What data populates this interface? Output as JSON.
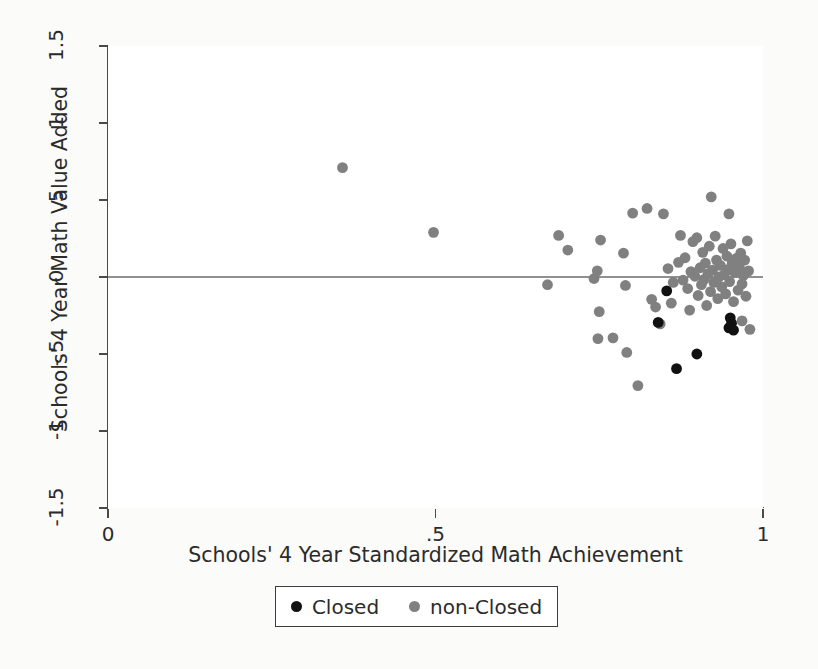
{
  "chart_data": {
    "type": "scatter",
    "title": "",
    "xlabel": "Schools' 4 Year Standardized Math Achievement",
    "ylabel": "Schools' 4 Year Math Value Added",
    "xlim": [
      0,
      1
    ],
    "ylim": [
      -1.5,
      1.5
    ],
    "xticks": [
      "0",
      ".5",
      "1"
    ],
    "xtick_values": [
      0,
      0.5,
      1
    ],
    "yticks": [
      "1.5",
      "1",
      ".5",
      "0",
      "-.5",
      "-1",
      "-1.5"
    ],
    "ytick_values": [
      1.5,
      1,
      0.5,
      0,
      -0.5,
      -1,
      -1.5
    ],
    "grid": false,
    "reference_line": {
      "orientation": "horizontal",
      "y": 0,
      "color": "#6b6b6b"
    },
    "legend_position": "below-axis",
    "series": [
      {
        "name": "Closed",
        "color": "#111111",
        "marker": "circle",
        "points": [
          [
            0.853,
            -0.09
          ],
          [
            0.84,
            -0.295
          ],
          [
            0.868,
            -0.595
          ],
          [
            0.899,
            -0.5
          ],
          [
            0.95,
            -0.265
          ],
          [
            0.952,
            -0.3
          ],
          [
            0.948,
            -0.33
          ],
          [
            0.955,
            -0.345
          ]
        ]
      },
      {
        "name": "non-Closed",
        "color": "#808080",
        "marker": "circle",
        "points": [
          [
            0.358,
            0.71
          ],
          [
            0.497,
            0.29
          ],
          [
            0.671,
            -0.05
          ],
          [
            0.688,
            0.27
          ],
          [
            0.702,
            0.175
          ],
          [
            0.742,
            -0.01
          ],
          [
            0.747,
            0.04
          ],
          [
            0.752,
            0.24
          ],
          [
            0.75,
            -0.225
          ],
          [
            0.748,
            -0.4
          ],
          [
            0.771,
            -0.395
          ],
          [
            0.787,
            0.155
          ],
          [
            0.79,
            -0.055
          ],
          [
            0.792,
            -0.49
          ],
          [
            0.801,
            0.415
          ],
          [
            0.809,
            -0.705
          ],
          [
            0.823,
            0.445
          ],
          [
            0.83,
            -0.145
          ],
          [
            0.836,
            -0.195
          ],
          [
            0.843,
            -0.305
          ],
          [
            0.848,
            0.41
          ],
          [
            0.855,
            0.055
          ],
          [
            0.86,
            -0.17
          ],
          [
            0.863,
            -0.035
          ],
          [
            0.871,
            0.095
          ],
          [
            0.874,
            0.27
          ],
          [
            0.878,
            -0.02
          ],
          [
            0.881,
            0.125
          ],
          [
            0.885,
            -0.075
          ],
          [
            0.888,
            -0.215
          ],
          [
            0.89,
            0.035
          ],
          [
            0.893,
            0.23
          ],
          [
            0.896,
            0.005
          ],
          [
            0.899,
            0.255
          ],
          [
            0.901,
            -0.12
          ],
          [
            0.904,
            0.06
          ],
          [
            0.906,
            -0.05
          ],
          [
            0.908,
            0.16
          ],
          [
            0.91,
            -0.015
          ],
          [
            0.912,
            0.09
          ],
          [
            0.914,
            -0.185
          ],
          [
            0.916,
            0.02
          ],
          [
            0.918,
            0.2
          ],
          [
            0.92,
            -0.095
          ],
          [
            0.921,
            0.52
          ],
          [
            0.923,
            0.045
          ],
          [
            0.925,
            -0.035
          ],
          [
            0.927,
            0.265
          ],
          [
            0.929,
            0.11
          ],
          [
            0.931,
            -0.14
          ],
          [
            0.933,
            0.0
          ],
          [
            0.935,
            0.075
          ],
          [
            0.937,
            -0.065
          ],
          [
            0.939,
            0.185
          ],
          [
            0.941,
            0.015
          ],
          [
            0.943,
            -0.11
          ],
          [
            0.945,
            0.135
          ],
          [
            0.947,
            0.05
          ],
          [
            0.949,
            -0.03
          ],
          [
            0.951,
            0.215
          ],
          [
            0.953,
            0.09
          ],
          [
            0.955,
            -0.16
          ],
          [
            0.957,
            0.03
          ],
          [
            0.959,
            0.12
          ],
          [
            0.948,
            0.41
          ],
          [
            0.962,
            -0.085
          ],
          [
            0.964,
            0.065
          ],
          [
            0.966,
            0.155
          ],
          [
            0.968,
            -0.045
          ],
          [
            0.97,
            0.01
          ],
          [
            0.972,
            0.11
          ],
          [
            0.974,
            -0.125
          ],
          [
            0.976,
            0.235
          ],
          [
            0.978,
            0.04
          ],
          [
            0.98,
            -0.34
          ],
          [
            0.968,
            -0.285
          ]
        ]
      }
    ]
  },
  "axes": {
    "y_title": "Schools' 4 Year Math Value Added",
    "x_title": "Schools' 4 Year Standardized Math Achievement"
  },
  "legend": {
    "entries": [
      {
        "label": "Closed",
        "color": "#111111"
      },
      {
        "label": "non-Closed",
        "color": "#808080"
      }
    ]
  }
}
